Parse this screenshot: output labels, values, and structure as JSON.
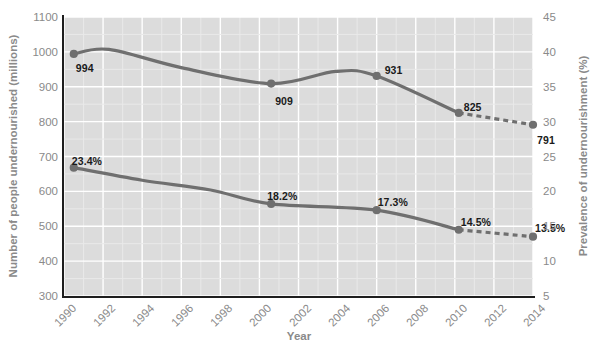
{
  "chart_data": {
    "type": "line",
    "title": "",
    "xlabel": "Year",
    "ylabel": "Number of people undernourished (millions)",
    "ylabel_right": "Prevalence of undernourishment (%)",
    "xlim": [
      1990,
      2014
    ],
    "ylim": [
      300,
      1100
    ],
    "ylim_right": [
      5,
      45
    ],
    "grid": true,
    "legend": "none",
    "x_ticks": [
      "1990",
      "1992",
      "1994",
      "1996",
      "1998",
      "2000",
      "2002",
      "2004",
      "2006",
      "2008",
      "2010",
      "2012",
      "2014"
    ],
    "y_ticks_left": [
      "300",
      "400",
      "500",
      "600",
      "700",
      "800",
      "900",
      "1000",
      "1100"
    ],
    "y_ticks_right": [
      "5",
      "10",
      "15",
      "20",
      "25",
      "30",
      "35",
      "40",
      "45"
    ],
    "series": [
      {
        "name": "Number of people undernourished (millions)",
        "axis": "left",
        "color": "#6f6f6f",
        "points": [
          {
            "x": 1990.5,
            "y": 994,
            "label": "994",
            "marker": true,
            "style": "solid"
          },
          {
            "x": 1992.3,
            "y": 1007,
            "label": "",
            "marker": false,
            "style": "solid"
          },
          {
            "x": 1996.0,
            "y": 955,
            "label": "",
            "marker": false,
            "style": "solid"
          },
          {
            "x": 2000.6,
            "y": 909,
            "label": "909",
            "marker": true,
            "style": "solid"
          },
          {
            "x": 2003.9,
            "y": 944,
            "label": "",
            "marker": false,
            "style": "solid"
          },
          {
            "x": 2006.0,
            "y": 931,
            "label": "931",
            "marker": true,
            "style": "solid"
          },
          {
            "x": 2010.2,
            "y": 825,
            "label": "825",
            "marker": true,
            "style": "solid"
          },
          {
            "x": 2014.0,
            "y": 791,
            "label": "791",
            "marker": true,
            "style": "dashed"
          }
        ]
      },
      {
        "name": "Prevalence of undernourishment (%)",
        "axis": "right",
        "color": "#6f6f6f",
        "points": [
          {
            "x": 1990.5,
            "y": 23.4,
            "label": "23.4%",
            "marker": true,
            "style": "solid"
          },
          {
            "x": 1994.0,
            "y": 21.6,
            "label": "",
            "marker": false,
            "style": "solid"
          },
          {
            "x": 1997.5,
            "y": 20.2,
            "label": "",
            "marker": false,
            "style": "solid"
          },
          {
            "x": 2000.6,
            "y": 18.2,
            "label": "18.2%",
            "marker": true,
            "style": "solid"
          },
          {
            "x": 2006.0,
            "y": 17.3,
            "label": "17.3%",
            "marker": true,
            "style": "solid"
          },
          {
            "x": 2010.2,
            "y": 14.5,
            "label": "14.5%",
            "marker": true,
            "style": "solid"
          },
          {
            "x": 2014.0,
            "y": 13.5,
            "label": "13.5%",
            "marker": true,
            "style": "dashed"
          }
        ]
      }
    ],
    "colors": {
      "plot_background": "#dcdcdc",
      "gridline_major": "#ffffff",
      "gridline_minor": "#e9e9e9",
      "axis_line": "#1e1e1e",
      "tick_text": "#8a8a8a",
      "line": "#6f6f6f",
      "data_label": "#1a1a1a",
      "page_background": "#ffffff"
    }
  }
}
